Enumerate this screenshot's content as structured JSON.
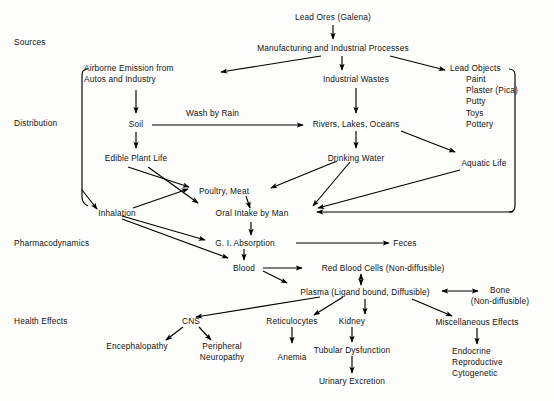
{
  "diagram": {
    "stage_labels": [
      {
        "id": "sources",
        "text": "Sources"
      },
      {
        "id": "distribution",
        "text": "Distribution"
      },
      {
        "id": "pharmacodynamics",
        "text": "Pharmacodynamics"
      },
      {
        "id": "health-effects",
        "text": "Health Effects"
      }
    ],
    "nodes": [
      {
        "id": "lead-ores",
        "text": "Lead Ores (Galena)"
      },
      {
        "id": "manufacturing",
        "text": "Manufacturing and Industrial Processes"
      },
      {
        "id": "airborne-emission",
        "line1": "Airborne Emission from",
        "line2": "Autos and Industry"
      },
      {
        "id": "industrial-wastes",
        "text": "Industrial Wastes"
      },
      {
        "id": "lead-objects",
        "text": "Lead Objects"
      },
      {
        "id": "soil",
        "text": "Soil"
      },
      {
        "id": "rivers-lakes-oceans",
        "text": "Rivers, Lakes, Oceans"
      },
      {
        "id": "edible-plant-life",
        "text": "Edible Plant Life"
      },
      {
        "id": "drinking-water",
        "text": "Drinking Water"
      },
      {
        "id": "aquatic-life",
        "text": "Aquatic Life"
      },
      {
        "id": "poultry-meat",
        "text": "Poultry, Meat"
      },
      {
        "id": "inhalation",
        "text": "Inhalation"
      },
      {
        "id": "oral-intake",
        "text": "Oral Intake by Man"
      },
      {
        "id": "gi-absorption",
        "text": "G. I. Absorption"
      },
      {
        "id": "feces",
        "text": "Feces"
      },
      {
        "id": "blood",
        "text": "Blood"
      },
      {
        "id": "red-blood-cells",
        "text": "Red Blood Cells (Non-diffusible)"
      },
      {
        "id": "plasma",
        "text": "Plasma (Ligand bound, Diffusible)"
      },
      {
        "id": "bone",
        "line1": "Bone",
        "line2": "(Non-diffusible)"
      },
      {
        "id": "cns",
        "text": "CNS"
      },
      {
        "id": "reticulocytes",
        "text": "Reticulocytes"
      },
      {
        "id": "kidney",
        "text": "Kidney"
      },
      {
        "id": "miscellaneous-effects",
        "text": "Miscellaneous Effects"
      },
      {
        "id": "encephalopathy",
        "text": "Encephalopathy"
      },
      {
        "id": "peripheral-neuropathy",
        "line1": "Peripheral",
        "line2": "Neuropathy"
      },
      {
        "id": "anemia",
        "text": "Anemia"
      },
      {
        "id": "tubular-dysfunction",
        "text": "Tubular Dysfunction"
      },
      {
        "id": "urinary-excretion",
        "text": "Urinary Excretion"
      },
      {
        "id": "endocrine-group",
        "line1": "Endocrine",
        "line2": "Reproductive",
        "line3": "Cytogenetic"
      }
    ],
    "lead_objects_items": [
      "Paint",
      "Plaster (Pica)",
      "Putty",
      "Toys",
      "Pottery"
    ],
    "edge_labels": [
      {
        "id": "wash-by-rain",
        "text": "Wash by Rain"
      }
    ],
    "colors": {
      "background": "#fdfdfb",
      "ink": "#111111",
      "stroke": "#000000"
    }
  }
}
